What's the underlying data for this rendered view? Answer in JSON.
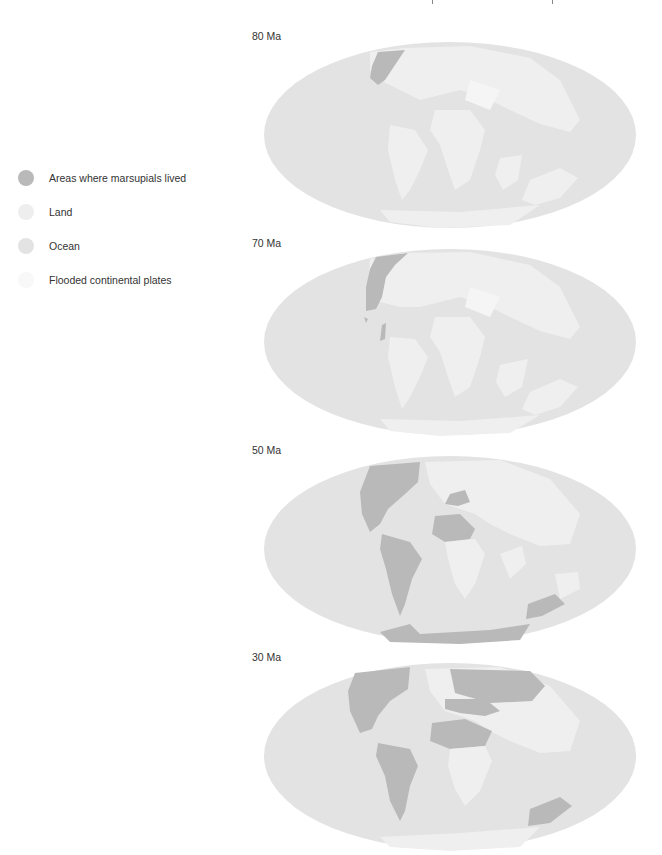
{
  "legend": {
    "items": [
      {
        "label": "Areas where marsupials lived",
        "color": "#b9b9b9"
      },
      {
        "label": "Land",
        "color": "#eeeeee"
      },
      {
        "label": "Ocean",
        "color": "#e3e3e3"
      },
      {
        "label": "Flooded continental plates",
        "color": "#f8f8f8"
      }
    ]
  },
  "colors": {
    "ocean": "#e3e3e3",
    "land": "#efefef",
    "flooded": "#f5f5f5",
    "marsupial": "#b9b9b9",
    "coast": "#fafafa"
  },
  "maps": [
    {
      "label": "80 Ma"
    },
    {
      "label": "70 Ma"
    },
    {
      "label": "50 Ma"
    },
    {
      "label": "30 Ma"
    }
  ]
}
